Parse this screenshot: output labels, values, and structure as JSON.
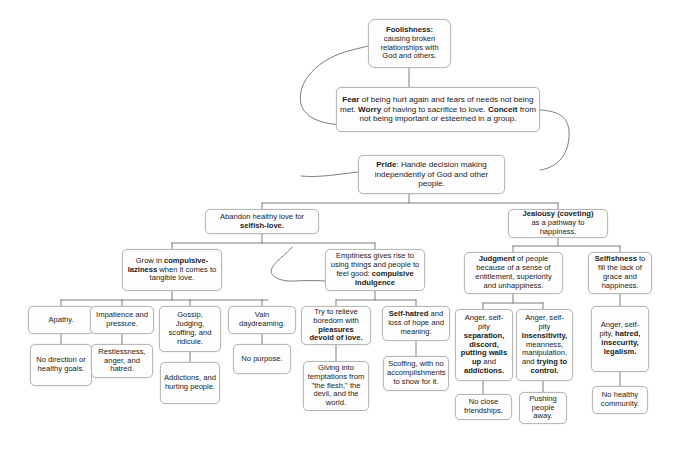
{
  "diagram": {
    "theme": {
      "box_border": "#b8b8b8",
      "box_fill": "#fdfdfd",
      "line": "#6e6e6e",
      "text": "#1c1c1c"
    },
    "nodes": {
      "foolishness": {
        "label_plain": "Foolishness: causing broken relationships with God and others.",
        "bold": "Foolishness:",
        "rest": "causing broken relationships with God and others."
      },
      "fear": {
        "label_plain": "Fear of being hurt again and fears of needs not being met. Worry of having to sacrifice to love. Conceit from not being important or esteemed in a group.",
        "bold_terms": [
          "Fear",
          "Worry",
          "Conceit"
        ]
      },
      "pride": {
        "label_plain": "Pride: Handle decision making independently of God and other people.",
        "bold": "Pride",
        "rest": ": Handle decision making independently of God and other people."
      },
      "abandon_love": {
        "label_plain": "Abandon healthy love for selfish-love.",
        "plain": "Abandon healthy love for ",
        "bold": "selfish-love."
      },
      "jealousy": {
        "label_plain": "Jealousy (coveting) as a pathway to happiness.",
        "bold": "Jealousy (coveting)",
        "rest": "as a pathway to happiness."
      },
      "laziness": {
        "label_plain": "Grow in compulsive-laziness when it comes to tangible love.",
        "p1": "Grow in ",
        "bold": "compulsive-laziness",
        "p2": " when it comes to tangible love."
      },
      "emptiness": {
        "label_plain": "Emptiness gives rise to using things and people to feel good: compulsive indulgence",
        "p1": "Emptiness gives rise to using things and people to feel good: ",
        "bold": "compulsive indulgence"
      },
      "judgment": {
        "label_plain": "Judgment of people because of a sense of entitlement, superiority and unhappiness.",
        "bold": "Judgment",
        "rest": " of people because of a sense of entitlement, superiority and unhappiness."
      },
      "selfishness": {
        "label_plain": "Selfishness to fill the lack of grace and happiness.",
        "bold": "Selfishness",
        "rest": " to fill the lack of grace and happiness."
      },
      "apathy": {
        "label_plain": "Apathy."
      },
      "impatience": {
        "label_plain": "Impatience and pressure."
      },
      "gossip": {
        "label_plain": "Gossip, Judging, scoffing, and ridicule."
      },
      "vain": {
        "label_plain": "Vain daydreaming."
      },
      "relieve": {
        "label_plain": "Try to relieve boredom with pleasures devoid of love.",
        "p1": "Try to relieve boredom with ",
        "bold": "pleasures devoid of love."
      },
      "selfhatred": {
        "label_plain": "Self-hatred and loss of hope and meaning.",
        "bold": "Self-hatred",
        "rest": " and loss of hope and meaning."
      },
      "anger_sep": {
        "label_plain": "Anger, self-pity separation, discord, putting walls up and addictions.",
        "p1": "Anger, self-pity ",
        "bold1": "separation, discord, putting walls up",
        "p2": " and ",
        "bold2": "addictions."
      },
      "anger_ins": {
        "label_plain": "Anger, self-pity Insensitivity, meanness, manipulation, and trying to control.",
        "p1": "Anger, self-pity ",
        "bold1": "Insensitivity,",
        "p2": " meanness, manipulation, and ",
        "bold2": "trying to control."
      },
      "anger_hat": {
        "label_plain": "Anger, self-pity, hatred, insecurity, legalism.",
        "p1": "Anger, self-pity, ",
        "bold1": "hatred, insecurity, legalism."
      },
      "nodirection": {
        "label_plain": "No direction or healthy goals."
      },
      "restlessness": {
        "label_plain": "Restlessness, anger, and hatred."
      },
      "addictions": {
        "label_plain": "Addictions, and hurting people."
      },
      "nopurpose": {
        "label_plain": "No purpose."
      },
      "temptations": {
        "label_plain": "Giving into temptations from \"the flesh,\" the devil, and the world."
      },
      "scoffing": {
        "label_plain": "Scoffing, with no accomplishments to show for it."
      },
      "noclose": {
        "label_plain": "No close friendships."
      },
      "pushing": {
        "label_plain": "Pushing people away."
      },
      "nohealthy": {
        "label_plain": "No healthy community."
      }
    }
  }
}
